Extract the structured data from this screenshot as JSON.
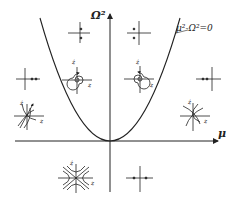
{
  "diagram": {
    "axes": {
      "vertical_label": "Ω²",
      "horizontal_label": "μ"
    },
    "curve": {
      "label": "μ²-Ω²=0",
      "shape": "parabola",
      "vertex": "origin"
    },
    "portrait_axis_labels": {
      "vertical": "ż",
      "horizontal": "z"
    },
    "portraits": [
      {
        "id": "p1",
        "region": "upper-left-inside",
        "type": "center",
        "features": "two dots on vertical axis"
      },
      {
        "id": "p2",
        "region": "upper-right-inside",
        "type": "center",
        "features": "two dots on vertical axis"
      },
      {
        "id": "p3",
        "region": "left-outside",
        "type": "real-roots",
        "features": "two dots on positive horizontal axis"
      },
      {
        "id": "p4",
        "region": "left-inside",
        "type": "stable-focus",
        "features": "spiral"
      },
      {
        "id": "p5",
        "region": "right-inside",
        "type": "unstable-focus",
        "features": "spiral"
      },
      {
        "id": "p6",
        "region": "right-outside",
        "type": "real-roots",
        "features": "two dots on negative horizontal axis"
      },
      {
        "id": "p7",
        "region": "left-outside-lower",
        "type": "node",
        "features": "trajectories with arrows"
      },
      {
        "id": "p8",
        "region": "right-outside-lower",
        "type": "node",
        "features": "curved trajectories"
      },
      {
        "id": "p9",
        "region": "below-axis-left",
        "type": "saddle",
        "features": "hyperbolic trajectories with asymptotes"
      },
      {
        "id": "p10",
        "region": "below-axis-right",
        "type": "saddle",
        "features": "two dots on horizontal axis either side"
      }
    ],
    "colors": {
      "ink": "#222222",
      "background": "#ffffff"
    }
  }
}
